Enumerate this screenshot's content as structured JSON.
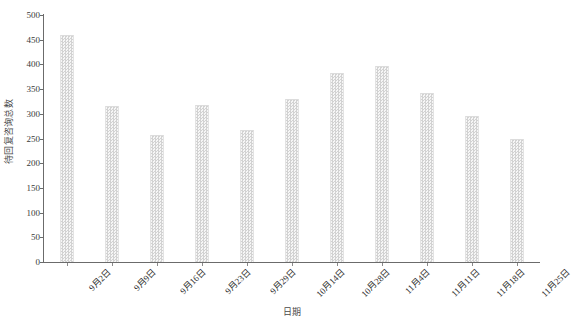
{
  "chart_data": {
    "type": "bar",
    "title": "",
    "subtitle": "",
    "xlabel": "日期",
    "ylabel": "待回复咨询总数",
    "categories": [
      "9月2日",
      "9月9日",
      "9月16日",
      "9月23日",
      "9月29日",
      "10月14日",
      "10月28日",
      "11月4日",
      "11月11日",
      "11月18日",
      "11月25日"
    ],
    "values": [
      460,
      316,
      257,
      317,
      267,
      330,
      382,
      397,
      342,
      296,
      250
    ],
    "series": [
      {
        "name": "待回复咨询总数",
        "values": [
          460,
          316,
          257,
          317,
          267,
          330,
          382,
          397,
          342,
          296,
          250
        ]
      }
    ],
    "ylim": [
      0,
      500
    ],
    "yticks": [
      0,
      50,
      100,
      150,
      200,
      250,
      300,
      350,
      400,
      450,
      500
    ],
    "ytick_labels": [
      "0",
      "50",
      "100",
      "150",
      "200",
      "250",
      "300",
      "350",
      "400",
      "450",
      "500"
    ],
    "grid": false,
    "legend": false,
    "legend_position": "none",
    "bar_fill_color": "#e9e9e9",
    "bar_pattern": "checkered-dots",
    "axis_color": "#6b6b6b",
    "background_color": "#ffffff",
    "annotations": []
  }
}
